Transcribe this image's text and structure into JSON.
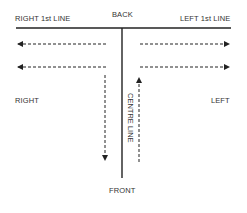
{
  "diagram": {
    "labels": {
      "back": "BACK",
      "front": "FRONT",
      "right_first_line": "RIGHT 1st LINE",
      "left_first_line": "LEFT 1st LINE",
      "right": "RIGHT",
      "left": "LEFT",
      "centre_line": "CENTRE LINE"
    },
    "lines": {
      "front_line": {
        "y": 28,
        "x1": 16,
        "x2": 231
      },
      "centre_line": {
        "x": 122,
        "y1": 28,
        "y2": 178
      }
    },
    "arrows": [
      {
        "id": "right-upper",
        "direction": "left",
        "y": 44
      },
      {
        "id": "right-lower",
        "direction": "left",
        "y": 67
      },
      {
        "id": "left-upper",
        "direction": "right",
        "y": 44
      },
      {
        "id": "left-lower",
        "direction": "right",
        "y": 67
      },
      {
        "id": "down-right-of-centre",
        "direction": "down",
        "x": 105
      },
      {
        "id": "up-left-of-centre",
        "direction": "up",
        "x": 139
      }
    ],
    "colors": {
      "line": "#222222",
      "text": "#333333",
      "background": "#ffffff"
    }
  }
}
